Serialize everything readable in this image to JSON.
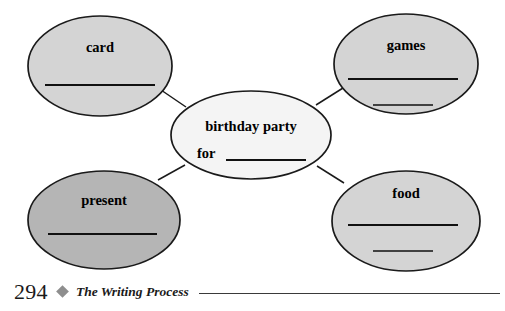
{
  "document": {
    "type": "cluster-diagram-worksheet"
  },
  "diagram": {
    "center": {
      "line1": "birthday party",
      "line2": "for",
      "blank_lines": 1,
      "fill": "#f4f4f4"
    },
    "nodes": [
      {
        "id": "card",
        "label": "card",
        "blank_lines": 1,
        "fill": "#d4d4d4",
        "position": "top-left"
      },
      {
        "id": "games",
        "label": "games",
        "blank_lines": 2,
        "fill": "#d4d4d4",
        "position": "top-right"
      },
      {
        "id": "present",
        "label": "present",
        "blank_lines": 1,
        "fill": "#b5b5b5",
        "position": "bottom-left"
      },
      {
        "id": "food",
        "label": "food",
        "blank_lines": 2,
        "fill": "#d4d4d4",
        "position": "bottom-right"
      }
    ],
    "outline_color": "#1a1a1a"
  },
  "footer": {
    "page_number": "294",
    "separator_icon": "diamond-icon",
    "title": "The Writing Process",
    "rule_color": "#3a3a3a"
  }
}
